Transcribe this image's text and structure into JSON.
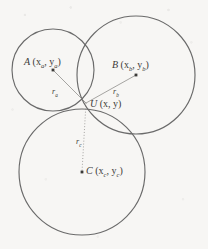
{
  "figure": {
    "name": "three-circle-trilateration-diagram",
    "background_color": "#f7f6f4",
    "stroke_color": "#6a6a6a",
    "text_color": "#3b3a38"
  },
  "circles": [
    {
      "id": "A",
      "cx": 53,
      "cy": 70,
      "r": 41
    },
    {
      "id": "B",
      "cx": 136,
      "cy": 75,
      "r": 59
    },
    {
      "id": "C",
      "cx": 82,
      "cy": 172,
      "r": 63
    }
  ],
  "points": {
    "A": {
      "x": 53,
      "y": 70,
      "label_main": "A",
      "label_coords_open": " (x",
      "sub1": "a",
      "label_mid": ", y",
      "sub2": "a",
      "label_close": ")"
    },
    "B": {
      "x": 136,
      "y": 75,
      "label_main": "B",
      "label_coords_open": " (x",
      "sub1": "b",
      "label_mid": ", y",
      "sub2": "b",
      "label_close": ")"
    },
    "C": {
      "x": 82,
      "y": 172,
      "label_main": "C",
      "label_coords_open": " (x",
      "sub1": "c",
      "label_mid": ", y",
      "sub2": "c",
      "label_close": ")"
    },
    "U": {
      "x": 86,
      "y": 103,
      "label_main": "U",
      "label_coords_open": " (x",
      "label_mid": ", y",
      "label_close": ")"
    }
  },
  "radii": [
    {
      "id": "ra",
      "symbol": "r",
      "sub": "a",
      "from": "U",
      "to": "A",
      "style": "solid"
    },
    {
      "id": "rb",
      "symbol": "r",
      "sub": "b",
      "from": "U",
      "to": "B",
      "style": "solid"
    },
    {
      "id": "rc",
      "symbol": "r",
      "sub": "c",
      "from": "U",
      "to": "C",
      "style": "dotted"
    }
  ]
}
